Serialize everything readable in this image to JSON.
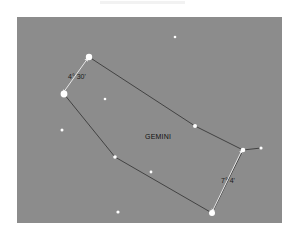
{
  "diagram": {
    "constellation_name": "GEMINI",
    "colors": {
      "background": "#8c8c8c",
      "page": "#ffffff",
      "constellation_line": "#3a3a3a",
      "measure_line": "#e6e6e6",
      "star": "#ffffff",
      "label": "#1a1a1a"
    },
    "measurements": [
      {
        "label": "4° 30'",
        "from": [
          63,
          93
        ],
        "to": [
          88,
          58
        ]
      },
      {
        "label": "7° 4'",
        "from": [
          212,
          212
        ],
        "to": [
          242,
          150
        ]
      }
    ],
    "constellation_stars": [
      {
        "x": 89,
        "y": 57,
        "r": 3.2
      },
      {
        "x": 64,
        "y": 94,
        "r": 3.4
      },
      {
        "x": 115,
        "y": 157,
        "r": 1.8
      },
      {
        "x": 212,
        "y": 213,
        "r": 3.0
      },
      {
        "x": 243,
        "y": 150,
        "r": 2.3
      },
      {
        "x": 261,
        "y": 148,
        "r": 1.6
      },
      {
        "x": 195,
        "y": 126,
        "r": 2.0
      }
    ],
    "outline_path": [
      [
        89,
        57
      ],
      [
        195,
        126
      ],
      [
        243,
        150
      ],
      [
        212,
        213
      ],
      [
        115,
        157
      ],
      [
        64,
        94
      ]
    ],
    "spur_path": [
      [
        243,
        150
      ],
      [
        261,
        148
      ]
    ],
    "field_stars": [
      {
        "x": 175,
        "y": 37,
        "r": 1.3
      },
      {
        "x": 105,
        "y": 99,
        "r": 1.3
      },
      {
        "x": 62,
        "y": 130,
        "r": 1.5
      },
      {
        "x": 151,
        "y": 172,
        "r": 1.4
      },
      {
        "x": 118,
        "y": 212,
        "r": 1.6
      }
    ]
  }
}
